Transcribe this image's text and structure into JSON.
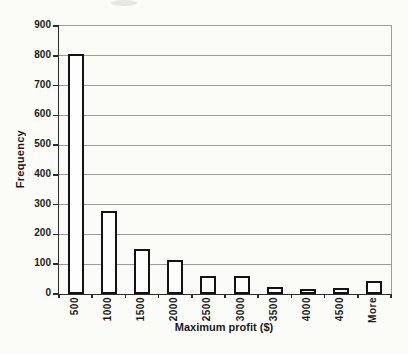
{
  "chart_data": {
    "type": "bar",
    "title": "",
    "xlabel": "Maximum profit ($)",
    "ylabel": "Frequency",
    "categories": [
      "500",
      "1000",
      "1500",
      "2000",
      "2500",
      "3000",
      "3500",
      "4000",
      "4500",
      "More"
    ],
    "values": [
      805,
      280,
      150,
      115,
      60,
      62,
      25,
      18,
      20,
      45
    ],
    "ylim": [
      0,
      900
    ],
    "yticks": [
      0,
      100,
      200,
      300,
      400,
      500,
      600,
      700,
      800,
      900
    ],
    "grid": "horizontal",
    "legend_position": "none",
    "x_tick_label_rotation": -90,
    "colors": {
      "background": "#fbfbf8",
      "bar_fill": "#fefefe",
      "bar_border": "#131313",
      "axis": "#2c2c2c",
      "gridline": "#9c9c9c",
      "text": "#1b1b1b"
    }
  }
}
